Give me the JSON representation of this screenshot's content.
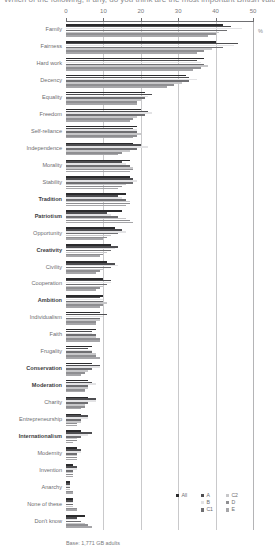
{
  "title": "Which of the following, if any, do you think are the most important British values?",
  "axis": {
    "unit_symbol": "%",
    "ticks": [
      0,
      10,
      20,
      30,
      40,
      50
    ],
    "xlim": [
      0,
      50
    ]
  },
  "footnote": "Base: 1,771 GB adults",
  "legend": {
    "columns": [
      [
        {
          "label": "All",
          "color": "#2b2b2d"
        }
      ],
      [
        {
          "label": "A",
          "color": "#4e4e51"
        },
        {
          "label": "B",
          "color": "#e3e3e5"
        },
        {
          "label": "C1",
          "color": "#6f6f72"
        }
      ],
      [
        {
          "label": "C2",
          "color": "#c7c7c9"
        },
        {
          "label": "D",
          "color": "#8f8f92"
        },
        {
          "label": "E",
          "color": "#a6a6a9"
        }
      ]
    ]
  },
  "chart_data": {
    "type": "bar",
    "orientation": "horizontal",
    "title": "Which of the following, if any, do you think are the most important British values?",
    "xlabel": "%",
    "ylabel": "",
    "xlim": [
      0,
      50
    ],
    "ticks": [
      0,
      10,
      20,
      30,
      40,
      50
    ],
    "grid": true,
    "legend_position": "bottom-right",
    "categories": [
      "Family",
      "Fairness",
      "Hard work",
      "Decency",
      "Equality",
      "Freedom",
      "Self-reliance",
      "Independence",
      "Morality",
      "Stability",
      "Tradition",
      "Patriotism",
      "Opportunity",
      "Creativity",
      "Civility",
      "Cooperation",
      "Ambition",
      "Individualism",
      "Faith",
      "Frugality",
      "Conservation",
      "Moderation",
      "Charity",
      "Entrepreneurship",
      "Internationalism",
      "Modernity",
      "Invention",
      "Anarchy",
      "None of these",
      "Don't know"
    ],
    "bold_categories": [
      "Tradition",
      "Patriotism",
      "Creativity",
      "Ambition",
      "Conservation",
      "Moderation",
      "Internationalism"
    ],
    "series": [
      {
        "name": "All",
        "color": "#2b2b2d",
        "values": [
          42,
          40,
          37,
          32,
          21,
          20,
          19,
          18,
          17,
          17,
          16,
          15,
          13,
          12,
          11,
          10,
          10,
          9,
          8,
          7,
          7,
          6,
          6,
          4,
          4,
          3,
          2,
          1,
          2,
          5
        ]
      },
      {
        "name": "A",
        "color": "#4e4e51",
        "values": [
          44,
          46,
          35,
          33,
          23,
          22,
          18,
          20,
          15,
          18,
          14,
          11,
          15,
          14,
          13,
          12,
          9,
          11,
          7,
          6,
          9,
          7,
          8,
          6,
          7,
          4,
          3,
          1,
          2,
          3
        ]
      },
      {
        "name": "B",
        "color": "#e3e3e5",
        "values": [
          47,
          45,
          36,
          35,
          22,
          23,
          19,
          22,
          16,
          19,
          15,
          12,
          16,
          13,
          14,
          12,
          10,
          10,
          7,
          7,
          9,
          8,
          8,
          6,
          6,
          4,
          3,
          1,
          2,
          3
        ]
      },
      {
        "name": "C1",
        "color": "#6f6f72",
        "values": [
          43,
          42,
          37,
          33,
          21,
          21,
          19,
          19,
          17,
          18,
          16,
          14,
          14,
          12,
          12,
          11,
          10,
          9,
          8,
          7,
          7,
          6,
          6,
          4,
          4,
          3,
          2,
          1,
          2,
          4
        ]
      },
      {
        "name": "C2",
        "color": "#c7c7c9",
        "values": [
          41,
          39,
          38,
          31,
          20,
          19,
          20,
          17,
          18,
          16,
          17,
          16,
          12,
          11,
          10,
          10,
          11,
          9,
          8,
          8,
          6,
          6,
          5,
          4,
          3,
          3,
          2,
          1,
          2,
          5
        ]
      },
      {
        "name": "D",
        "color": "#8f8f92",
        "values": [
          40,
          37,
          36,
          29,
          19,
          18,
          19,
          15,
          18,
          15,
          17,
          17,
          11,
          10,
          9,
          9,
          10,
          8,
          9,
          8,
          5,
          5,
          5,
          3,
          3,
          3,
          2,
          2,
          3,
          6
        ]
      },
      {
        "name": "E",
        "color": "#a6a6a9",
        "values": [
          38,
          35,
          34,
          27,
          19,
          17,
          18,
          14,
          17,
          14,
          16,
          18,
          10,
          9,
          8,
          8,
          9,
          8,
          9,
          9,
          4,
          5,
          4,
          3,
          2,
          3,
          2,
          2,
          3,
          7
        ]
      }
    ]
  }
}
